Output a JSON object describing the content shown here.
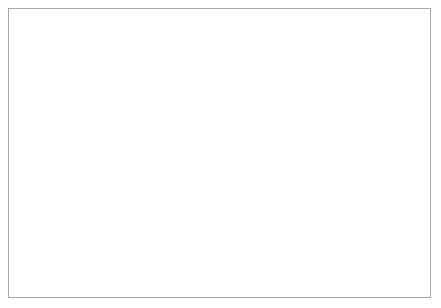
{
  "chart_data": {
    "type": "line",
    "title": "",
    "subtitle": "",
    "xlabel": "",
    "ylabel": "",
    "xlim": [
      1989,
      2012
    ],
    "ylim": [
      0,
      60
    ],
    "ytick_labels": [
      "0%",
      "10%",
      "20%",
      "30%",
      "40%",
      "50%",
      "60%"
    ],
    "ytick_values": [
      0,
      10,
      20,
      30,
      40,
      50,
      60
    ],
    "xtick_labels": [
      "1989",
      "1994",
      "1999",
      "2004",
      "2009"
    ],
    "xtick_values": [
      1989,
      1994,
      1999,
      2004,
      2009
    ],
    "grid": "horizontal-and-vertical",
    "legend_position": "bottom",
    "value_suffix": "%",
    "series": [
      {
        "name": "Government current spending",
        "marker": "square",
        "color": "#7a7a7a",
        "x": [
          1989,
          1995,
          2000,
          2005,
          2006,
          2007,
          2008,
          2009,
          2010,
          2011,
          2012
        ],
        "values": [
          34.2,
          27.5,
          30.5,
          44.3,
          41.2,
          46.8,
          52.7,
          52.7,
          49.8,
          45.2,
          42.8
        ]
      },
      {
        "name": "Government investment",
        "marker": "circle",
        "color": "#1a1a1a",
        "x": [
          1989,
          1995,
          2000,
          2005,
          2006,
          2007,
          2008,
          2009,
          2010,
          2011,
          2012
        ],
        "values": [
          14.3,
          6.8,
          6.1,
          7.8,
          9.5,
          9.2,
          9.2,
          9.2,
          6.9,
          6.6,
          9.4
        ]
      },
      {
        "name": "Private and cooperative",
        "marker": "triangle",
        "color": "#8a8a8a",
        "x": [
          1989,
          1995,
          2000,
          2005,
          2006,
          2007,
          2008,
          2009,
          2010,
          2011,
          2012
        ],
        "values": [
          5.0,
          11.5,
          16.7,
          18.2,
          16.3,
          15.6,
          15.2,
          14.8,
          15.0,
          22.9,
          24.5
        ]
      },
      {
        "name": "State enterprises",
        "marker": "diamond",
        "color": "#262626",
        "x": [
          1989,
          1995,
          2000,
          2005,
          2006,
          2007,
          2008,
          2009,
          2010,
          2011,
          2012
        ],
        "values": [
          46.5,
          54.0,
          47.4,
          31.0,
          33.9,
          29.8,
          24.6,
          24.6,
          30.5,
          26.6,
          24.6
        ]
      }
    ]
  },
  "legend": {
    "items": [
      {
        "label": "Government current spending",
        "marker": "square",
        "color": "#7a7a7a"
      },
      {
        "label": "Government investment",
        "marker": "circle",
        "color": "#1a1a1a"
      },
      {
        "label": "Private and cooperative",
        "marker": "triangle",
        "color": "#8a8a8a"
      },
      {
        "label": "State enterprises",
        "marker": "diamond",
        "color": "#262626"
      }
    ]
  }
}
